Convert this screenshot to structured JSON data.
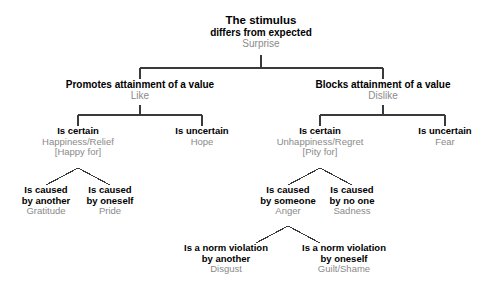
{
  "diagram": {
    "line_color": "#3a3a3a",
    "condition_color": "#000000",
    "emotion_color": "#8a8a8a",
    "background": "#ffffff"
  },
  "nodes": {
    "root": {
      "condition_line1": "The stimulus",
      "condition_line2": "differs from expected",
      "emotion": "Surprise"
    },
    "promotes": {
      "condition_line1": "Promotes attainment of a value",
      "emotion": "Like"
    },
    "blocks": {
      "condition_line1": "Blocks attainment of a value",
      "emotion": "Dislike"
    },
    "certain_like": {
      "condition_line1": "Is certain",
      "emotion": "Happiness/Relief",
      "bracket": "[Happy for]"
    },
    "uncertain_like": {
      "condition_line1": "Is uncertain",
      "emotion": "Hope"
    },
    "certain_dislike": {
      "condition_line1": "Is certain",
      "emotion": "Unhappiness/Regret",
      "bracket": "[Pity for]"
    },
    "uncertain_dislike": {
      "condition_line1": "Is uncertain",
      "emotion": "Fear"
    },
    "caused_by_another": {
      "condition_line1": "Is caused",
      "condition_line2": "by another",
      "emotion": "Gratitude"
    },
    "caused_by_oneself": {
      "condition_line1": "Is caused",
      "condition_line2": "by oneself",
      "emotion": "Pride"
    },
    "caused_by_someone": {
      "condition_line1": "Is caused",
      "condition_line2": "by someone",
      "emotion": "Anger"
    },
    "caused_by_no_one": {
      "condition_line1": "Is caused",
      "condition_line2": "by no one",
      "emotion": "Sadness"
    },
    "norm_violation_another": {
      "condition_line1": "Is a norm violation",
      "condition_line2": "by another",
      "emotion": "Disgust"
    },
    "norm_violation_oneself": {
      "condition_line1": "Is a norm violation",
      "condition_line2": "by oneself",
      "emotion": "Guilt/Shame"
    }
  }
}
